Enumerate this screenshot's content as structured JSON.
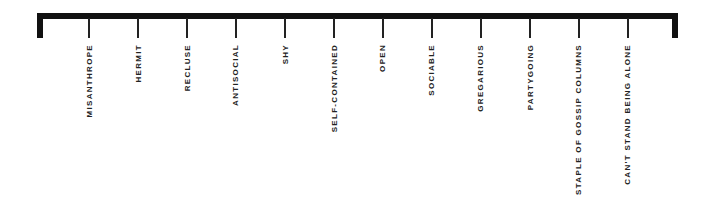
{
  "scale": {
    "left_end": {
      "x": 37
    },
    "right_end": {
      "x": 672
    },
    "items": [
      {
        "label": "MISANTHROPE",
        "x": 89
      },
      {
        "label": "HERMIT",
        "x": 138
      },
      {
        "label": "RECLUSE",
        "x": 187
      },
      {
        "label": "ANTISOCIAL",
        "x": 236
      },
      {
        "label": "SHY",
        "x": 285
      },
      {
        "label": "SELF-CONTAINED",
        "x": 334
      },
      {
        "label": "OPEN",
        "x": 383
      },
      {
        "label": "SOCIABLE",
        "x": 432
      },
      {
        "label": "GREGARIOUS",
        "x": 481
      },
      {
        "label": "PARTYGOING",
        "x": 530
      },
      {
        "label": "STAPLE OF GOSSIP COLUMNS",
        "x": 579
      },
      {
        "label": "CAN'T STAND BEING ALONE",
        "x": 628
      }
    ]
  },
  "colors": {
    "line": "#111111",
    "text": "#222222",
    "background": "#ffffff"
  }
}
